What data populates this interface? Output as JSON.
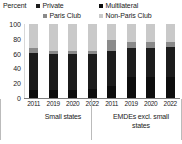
{
  "chart_data": {
    "type": "bar",
    "stacked": true,
    "title": "",
    "subtitle": "",
    "xlabel": "",
    "ylabel": "Percent",
    "ylim": [
      0,
      100
    ],
    "yticks": [
      0,
      20,
      40,
      60,
      80,
      100
    ],
    "grid": false,
    "legend_position": "top",
    "categories": [
      "2011",
      "2019",
      "2020",
      "2022",
      "2011",
      "2019",
      "2020",
      "2022"
    ],
    "groups": [
      {
        "label": "Small states",
        "categories": [
          "2011",
          "2019",
          "2020",
          "2022"
        ]
      },
      {
        "label": "EMDEs excl. small states",
        "categories": [
          "2011",
          "2019",
          "2020",
          "2022"
        ]
      }
    ],
    "series": [
      {
        "name": "Multilateral",
        "color": "#0d0d0d",
        "values": [
          11,
          11,
          11,
          12,
          16,
          28,
          28,
          29
        ]
      },
      {
        "name": "Private",
        "color": "#1c1c1c",
        "values": [
          50,
          48,
          48,
          47,
          48,
          39,
          40,
          40
        ]
      },
      {
        "name": "Paris Club",
        "color": "#8a8a8a",
        "values": [
          6,
          5,
          5,
          5,
          14,
          9,
          8,
          7
        ]
      },
      {
        "name": "Non-Paris Club",
        "color": "#c9c9c9",
        "values": [
          33,
          36,
          36,
          36,
          22,
          24,
          24,
          24
        ]
      }
    ]
  },
  "legend": {
    "axis_title": "Percent",
    "items": [
      {
        "label": "Private",
        "color": "#1c1c1c",
        "icon": "square-swatch-icon"
      },
      {
        "label": "Multilateral",
        "color": "#0d0d0d",
        "icon": "square-swatch-icon"
      },
      {
        "label": "Paris Club",
        "color": "#8a8a8a",
        "icon": "square-swatch-icon"
      },
      {
        "label": "Non-Paris Club",
        "color": "#c9c9c9",
        "icon": "square-swatch-icon"
      }
    ]
  },
  "y_axis": {
    "ticks": [
      "100",
      "80",
      "60",
      "40",
      "20",
      "0"
    ]
  },
  "x_axis": {
    "group1_ticks": [
      "2011",
      "2019",
      "2020",
      "2022"
    ],
    "group2_ticks": [
      "2011",
      "2019",
      "2020",
      "2022"
    ]
  },
  "group_labels": {
    "group1": "Small states",
    "group2": "EMDEs excl. small states"
  },
  "colors": {
    "multilateral": "#0d0d0d",
    "private": "#1c1c1c",
    "paris_club": "#8a8a8a",
    "non_paris_club": "#c9c9c9",
    "axis": "#7d7d7d",
    "text": "#222222",
    "background": "#ffffff"
  }
}
